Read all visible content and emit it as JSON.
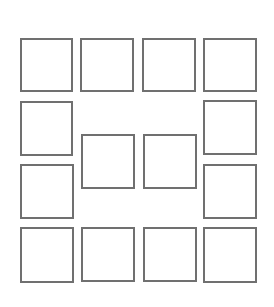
{
  "diagram": {
    "stroke_color": "#707070",
    "background": "#ffffff",
    "squares": [
      {
        "id": "r1c1",
        "x": 20,
        "y": 38,
        "w": 53,
        "h": 54
      },
      {
        "id": "r1c2",
        "x": 80,
        "y": 38,
        "w": 54,
        "h": 54
      },
      {
        "id": "r1c3",
        "x": 142,
        "y": 38,
        "w": 54,
        "h": 54
      },
      {
        "id": "r1c4",
        "x": 203,
        "y": 38,
        "w": 54,
        "h": 54
      },
      {
        "id": "r2c1",
        "x": 20,
        "y": 101,
        "w": 53,
        "h": 55
      },
      {
        "id": "r2c4",
        "x": 203,
        "y": 100,
        "w": 54,
        "h": 55
      },
      {
        "id": "mid-left",
        "x": 81,
        "y": 134,
        "w": 54,
        "h": 55
      },
      {
        "id": "mid-right",
        "x": 143,
        "y": 134,
        "w": 54,
        "h": 55
      },
      {
        "id": "r3c1",
        "x": 20,
        "y": 164,
        "w": 54,
        "h": 55
      },
      {
        "id": "r3c4",
        "x": 203,
        "y": 164,
        "w": 54,
        "h": 55
      },
      {
        "id": "r4c1",
        "x": 20,
        "y": 227,
        "w": 54,
        "h": 56
      },
      {
        "id": "r4c2",
        "x": 81,
        "y": 227,
        "w": 54,
        "h": 55
      },
      {
        "id": "r4c3",
        "x": 143,
        "y": 227,
        "w": 54,
        "h": 55
      },
      {
        "id": "r4c4",
        "x": 203,
        "y": 227,
        "w": 54,
        "h": 56
      }
    ]
  }
}
